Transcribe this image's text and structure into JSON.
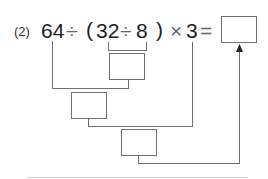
{
  "problem": {
    "number_label": "(2)",
    "expression_tokens": [
      "64",
      "÷",
      "(",
      "32",
      "÷",
      "8",
      ")",
      "×",
      "3",
      "="
    ],
    "answer_box": ""
  },
  "diagram": {
    "steps": [
      {
        "name": "step-1-box",
        "operation": "32 ÷ 8",
        "value": ""
      },
      {
        "name": "step-2-box",
        "operation": "64 ÷ (step 1)",
        "value": ""
      },
      {
        "name": "step-3-box",
        "operation": "(step 2) × 3",
        "value": ""
      }
    ],
    "arrow": "result-to-answer"
  }
}
